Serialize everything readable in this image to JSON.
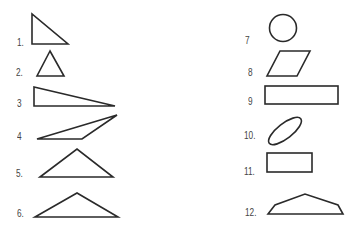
{
  "figure": {
    "labels": [
      "1.",
      "2.",
      "3",
      "4",
      "5.",
      "6.",
      "7",
      "8",
      "9",
      "10.",
      "11.",
      "12."
    ],
    "shapes": [
      {
        "id": 1,
        "kind": "right-triangle"
      },
      {
        "id": 2,
        "kind": "equilateral-triangle"
      },
      {
        "id": 3,
        "kind": "long-right-triangle"
      },
      {
        "id": 4,
        "kind": "obtuse-scalene-triangle"
      },
      {
        "id": 5,
        "kind": "isosceles-triangle"
      },
      {
        "id": 6,
        "kind": "wide-isosceles-triangle"
      },
      {
        "id": 7,
        "kind": "circle"
      },
      {
        "id": 8,
        "kind": "parallelogram"
      },
      {
        "id": 9,
        "kind": "long-rectangle"
      },
      {
        "id": 10,
        "kind": "tilted-ellipse"
      },
      {
        "id": 11,
        "kind": "rectangle"
      },
      {
        "id": 12,
        "kind": "pentagon-trapezoid"
      }
    ],
    "stroke_color": "#2a2a2a",
    "label_color": "#444444"
  }
}
